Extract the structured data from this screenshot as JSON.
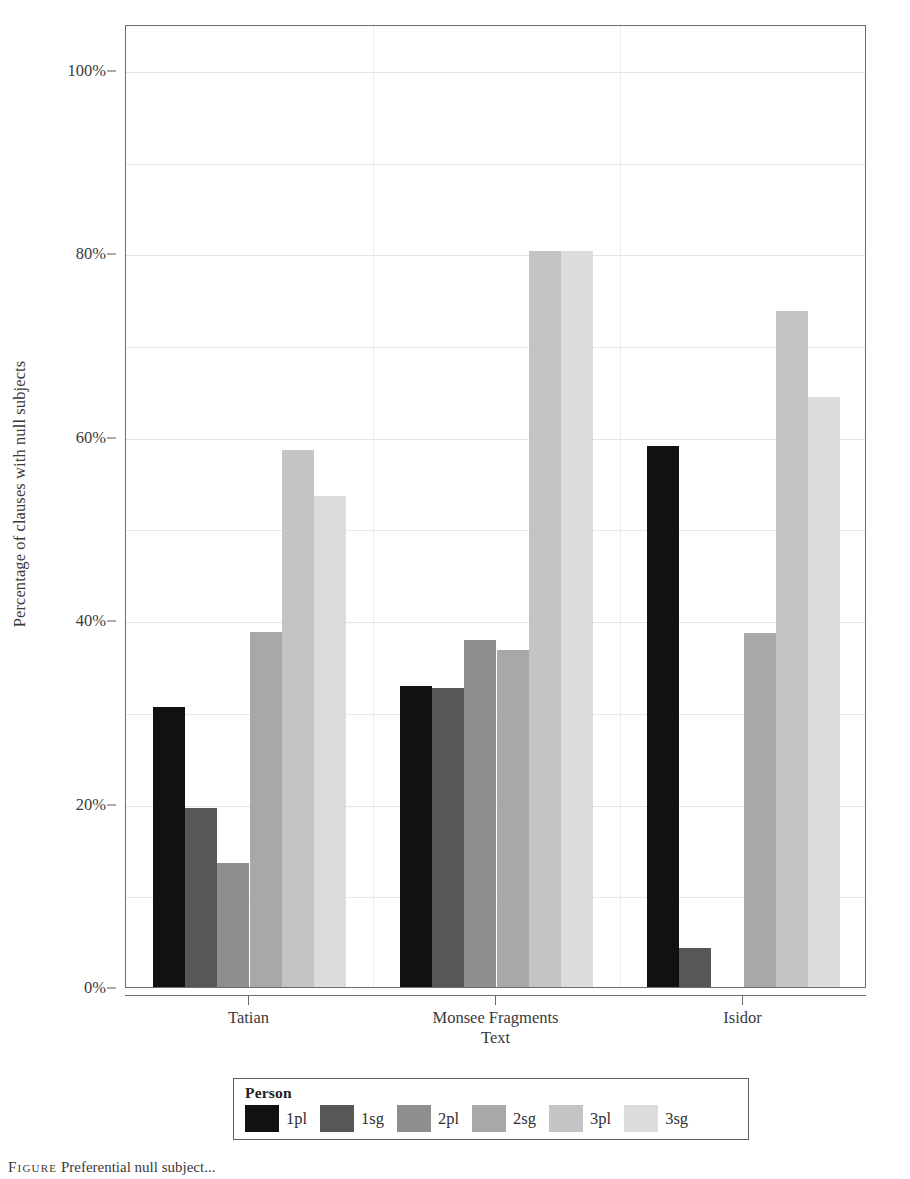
{
  "chart_data": {
    "type": "bar",
    "title": "",
    "xlabel": "Text",
    "ylabel": "Percentage of clauses with null subjects",
    "categories": [
      "Tatian",
      "Monsee Fragments",
      "Isidor"
    ],
    "ylim": [
      0,
      105
    ],
    "ytick_values": [
      0,
      20,
      40,
      60,
      80,
      100
    ],
    "ytick_labels": [
      "0%",
      "20%",
      "40%",
      "60%",
      "80%",
      "100%"
    ],
    "grid": true,
    "grid_minor_values": [
      10,
      30,
      50,
      70,
      90
    ],
    "legend_title": "Person",
    "legend_position": "bottom",
    "series": [
      {
        "name": "1pl",
        "color": "#111111",
        "values": [
          30.5,
          32.8,
          59.0
        ]
      },
      {
        "name": "1sg",
        "color": "#575757",
        "values": [
          19.5,
          32.6,
          4.2
        ]
      },
      {
        "name": "2pl",
        "color": "#8e8e8e",
        "values": [
          13.5,
          37.8,
          0
        ]
      },
      {
        "name": "2sg",
        "color": "#a8a8a8",
        "values": [
          38.7,
          36.8,
          38.6
        ]
      },
      {
        "name": "3pl",
        "color": "#c4c4c4",
        "values": [
          58.6,
          80.3,
          73.7
        ]
      },
      {
        "name": "3sg",
        "color": "#dcdcdc",
        "values": [
          53.5,
          80.3,
          64.3
        ]
      }
    ]
  },
  "caption": {
    "label": "Figure",
    "text": "Preferential null subject..."
  }
}
